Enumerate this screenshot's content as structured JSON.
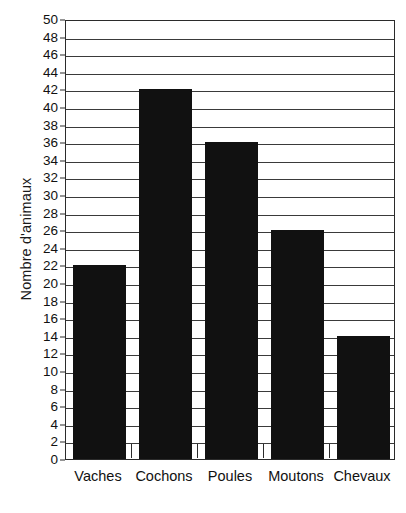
{
  "chart_data": {
    "type": "bar",
    "title": "",
    "subtitle": "",
    "xlabel": "",
    "ylabel": "Nombre d'animaux",
    "categories": [
      "Vaches",
      "Cochons",
      "Poules",
      "Moutons",
      "Chevaux"
    ],
    "values": [
      22,
      42,
      36,
      26,
      14
    ],
    "series": [
      {
        "name": "Nombre d'animaux",
        "values": [
          22,
          42,
          36,
          26,
          14
        ]
      }
    ],
    "ylim": [
      0,
      50
    ],
    "ytick_step": 2,
    "ytick_labels": [
      "0",
      "2",
      "4",
      "6",
      "8",
      "10",
      "12",
      "14",
      "16",
      "18",
      "20",
      "22",
      "24",
      "26",
      "28",
      "30",
      "32",
      "34",
      "36",
      "38",
      "40",
      "42",
      "44",
      "46",
      "48",
      "50"
    ],
    "ytick_values": [
      0,
      2,
      4,
      6,
      8,
      10,
      12,
      14,
      16,
      18,
      20,
      22,
      24,
      26,
      28,
      30,
      32,
      34,
      36,
      38,
      40,
      42,
      44,
      46,
      48,
      50
    ],
    "grid": true,
    "grid_axis": "y",
    "legend": false,
    "legend_position": "none",
    "bar_color": "#111111",
    "axis_color": "#2b2b2b",
    "grid_color": "#3a3a3a",
    "background_color": "#ffffff",
    "annotations": []
  }
}
